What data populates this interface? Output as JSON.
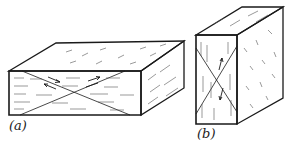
{
  "figure": {
    "panels": [
      {
        "id": "a",
        "label": "(a)",
        "description": "Flat rectangular block with diagonal cross on front face and shear arrows"
      },
      {
        "id": "b",
        "label": "(b)",
        "description": "Tall rectangular block with diagonal cross on front face and shear arrows"
      }
    ],
    "colors": {
      "line": "#1a1a1a",
      "hatch": "#555555",
      "background": "#ffffff"
    }
  }
}
